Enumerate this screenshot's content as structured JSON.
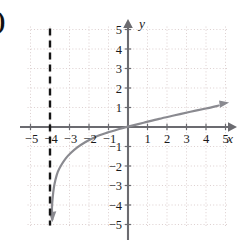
{
  "figure": {
    "item_label": ")",
    "background_color": "#ffffff",
    "width": 242,
    "height": 248
  },
  "chart_data": {
    "type": "line",
    "title": "",
    "subtitle": "",
    "xlabel": "x",
    "ylabel": "y",
    "xlim": [
      -5.6,
      5.6
    ],
    "ylim": [
      -5.6,
      5.6
    ],
    "grid": true,
    "grid_style": "dotted",
    "grid_color": "#d8c9c9",
    "legend": "none",
    "origin_label": "",
    "x_ticks": [
      -5,
      -4,
      -3,
      -2,
      -1,
      1,
      2,
      3,
      4,
      5
    ],
    "x_tick_labels": [
      "−5",
      "−4",
      "−3",
      "−2",
      "−1",
      "1",
      "2",
      "3",
      "4",
      "5"
    ],
    "y_ticks": [
      5,
      4,
      3,
      2,
      1,
      -1,
      -2,
      -3,
      -4,
      -5
    ],
    "y_tick_labels": [
      "5",
      "4",
      "3",
      "2",
      "1",
      "−1",
      "−2",
      "−3",
      "−4",
      "−5"
    ],
    "axis_color": "#6b6b70",
    "series": [
      {
        "name": "logarithmic-curve",
        "kind": "curve",
        "color": "#8a8a90",
        "linewidth": 2.2,
        "function": "log",
        "vertical_asymptote": -4,
        "x_intercept": -0.15,
        "arrow_start": {
          "x": -3.85,
          "y": -4.8
        },
        "arrow_end": {
          "x": 4.7,
          "y": 1.12
        },
        "points": [
          {
            "x": -3.88,
            "y": -4.75
          },
          {
            "x": -3.9,
            "y": -4.2
          },
          {
            "x": -3.86,
            "y": -3.6
          },
          {
            "x": -3.8,
            "y": -3.1
          },
          {
            "x": -3.72,
            "y": -2.7
          },
          {
            "x": -3.6,
            "y": -2.3
          },
          {
            "x": -3.42,
            "y": -1.95
          },
          {
            "x": -3.2,
            "y": -1.62
          },
          {
            "x": -2.95,
            "y": -1.35
          },
          {
            "x": -2.6,
            "y": -1.05
          },
          {
            "x": -2.2,
            "y": -0.78
          },
          {
            "x": -1.7,
            "y": -0.52
          },
          {
            "x": -1.1,
            "y": -0.3
          },
          {
            "x": -0.45,
            "y": -0.1
          },
          {
            "x": 0,
            "y": 0.02
          },
          {
            "x": 0.8,
            "y": 0.22
          },
          {
            "x": 1.6,
            "y": 0.42
          },
          {
            "x": 2.4,
            "y": 0.6
          },
          {
            "x": 3.2,
            "y": 0.78
          },
          {
            "x": 4.0,
            "y": 0.95
          },
          {
            "x": 4.65,
            "y": 1.1
          }
        ]
      },
      {
        "name": "vertical-asymptote",
        "kind": "dashed-vertical-line",
        "color": "#151515",
        "linewidth": 2.4,
        "dash": "7,5",
        "x": -4,
        "y_from": 5.05,
        "y_to": -5.05
      }
    ]
  }
}
